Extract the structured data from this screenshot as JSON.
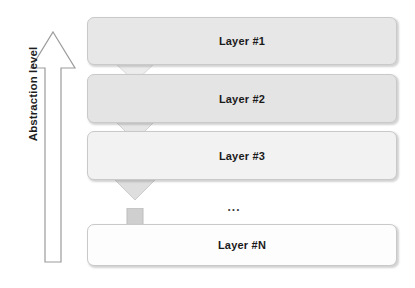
{
  "figure": {
    "background_color": "#ffffff"
  },
  "axis": {
    "label": "Abstraction level",
    "direction": "up",
    "icon": "up-arrow-outline-icon",
    "stroke_color": "#9a9a9a",
    "fill_color": "#ffffff"
  },
  "layers": [
    {
      "label": "Layer #1",
      "fill": "#e7e7e7",
      "border": "#c9c9c9"
    },
    {
      "label": "Layer #2",
      "fill": "#e4e4e4",
      "border": "#c9c9c9"
    },
    {
      "label": "Layer #3",
      "fill": "#f2f2f2",
      "border": "#c9c9c9"
    },
    {
      "label": "Layer #N",
      "fill": "#fdfdfd",
      "border": "#c9c9c9"
    }
  ],
  "connectors": [
    {
      "icon": "down-arrow-icon",
      "fill": "#ececec",
      "stroke": "#d8d8d8"
    },
    {
      "icon": "down-arrow-icon",
      "fill": "#e6e6e6",
      "stroke": "#d2d2d2"
    },
    {
      "icon": "down-arrow-icon",
      "fill": "#dedede",
      "stroke": "#cccccc"
    },
    {
      "icon": "down-arrow-icon",
      "fill": "#cfcfcf",
      "stroke": "#bdbdbd"
    }
  ],
  "continuation": {
    "ellipsis": "..."
  }
}
